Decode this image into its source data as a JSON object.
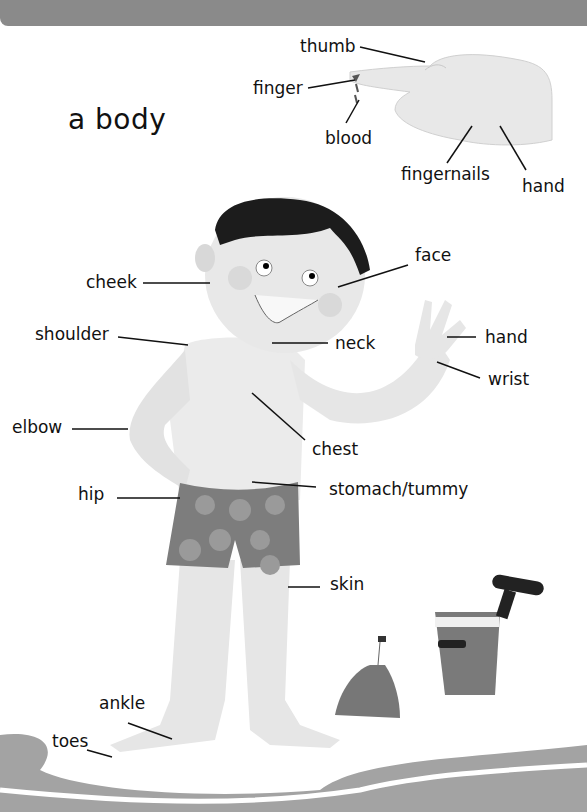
{
  "page": {
    "title": "a body",
    "colors": {
      "header_bar": "#8a8a8a",
      "skin": "#e4e4e4",
      "hair": "#1a1a1a",
      "shorts": "#7a7a7a",
      "sand": "#9c9c9c"
    }
  },
  "hand_diagram": {
    "labels": {
      "thumb": "thumb",
      "finger": "finger",
      "blood": "blood",
      "fingernails": "fingernails",
      "hand": "hand"
    }
  },
  "body_diagram": {
    "labels": {
      "cheek": "cheek",
      "face": "face",
      "shoulder": "shoulder",
      "neck": "neck",
      "hand": "hand",
      "wrist": "wrist",
      "elbow": "elbow",
      "chest": "chest",
      "hip": "hip",
      "stomach": "stomach/tummy",
      "skin": "skin",
      "ankle": "ankle",
      "toes": "toes"
    }
  },
  "scene_items": [
    "sandcastle",
    "bucket",
    "spade"
  ]
}
